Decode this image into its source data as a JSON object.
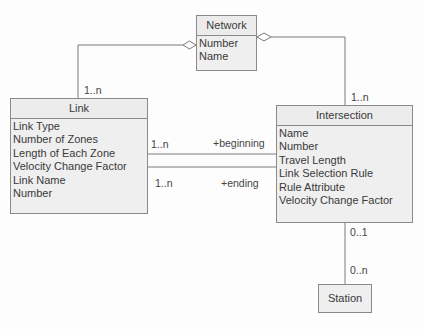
{
  "classes": {
    "network": {
      "name": "Network",
      "attributes": [
        "Number",
        "Name"
      ]
    },
    "link": {
      "name": "Link",
      "attributes": [
        "Link Type",
        "Number of Zones",
        "Length of Each Zone",
        "Velocity Change Factor",
        "Link Name",
        "Number"
      ]
    },
    "intersection": {
      "name": "Intersection",
      "attributes": [
        "Name",
        "Number",
        "Travel Length",
        "Link Selection Rule",
        "Rule Attribute",
        "Velocity Change Factor"
      ]
    },
    "station": {
      "name": "Station",
      "attributes": []
    }
  },
  "associations": {
    "network_link": {
      "type": "aggregation",
      "multiplicity_link": "1..n"
    },
    "network_intersection": {
      "type": "aggregation",
      "multiplicity_intersection": "1..n"
    },
    "link_intersection_beginning": {
      "multiplicity": "1..n",
      "role": "+beginning"
    },
    "link_intersection_ending": {
      "multiplicity": "1..n",
      "role": "+ending"
    },
    "intersection_station": {
      "multiplicity_intersection": "0..1",
      "multiplicity_station": "0..n"
    }
  }
}
